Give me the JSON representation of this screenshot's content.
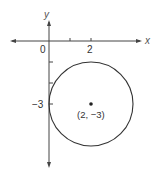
{
  "figure": {
    "type": "coordinate-plane-circle",
    "axes": {
      "x_label": "x",
      "y_label": "y",
      "origin_label": "0",
      "x_tick_label": "2",
      "y_tick_label": "−3",
      "x_ticks": [
        1,
        2
      ],
      "y_ticks": [
        -1,
        -2,
        -3
      ]
    },
    "circle": {
      "center": [
        2,
        -3
      ],
      "radius": 2,
      "center_label": "(2, −3)"
    },
    "colors": {
      "stroke": "#333333",
      "background": "#ffffff"
    }
  }
}
